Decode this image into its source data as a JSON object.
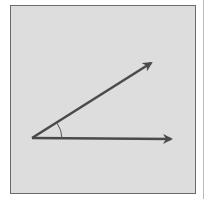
{
  "diagram": {
    "type": "angle",
    "background_color": "#dddddd",
    "border_color": "#6b6b6b",
    "stroke_color": "#4a4a4a",
    "vertex": {
      "x": 32,
      "y": 138
    },
    "rays": [
      {
        "name": "horizontal-ray",
        "tip": {
          "x": 173,
          "y": 139
        }
      },
      {
        "name": "inclined-ray",
        "tip": {
          "x": 153,
          "y": 62
        }
      }
    ],
    "angle_arc": {
      "radius": 30
    }
  }
}
